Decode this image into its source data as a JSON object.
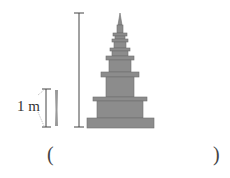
{
  "diagram": {
    "reference_label": "1 m",
    "answer_open": "(",
    "answer_close": ")",
    "answer_value": "",
    "colors": {
      "tower": "#8c8c8c",
      "tower_dark": "#6e6e6e",
      "line": "#444444"
    }
  }
}
